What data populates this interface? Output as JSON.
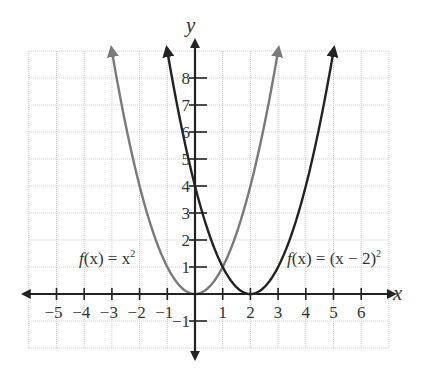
{
  "chart_data": {
    "type": "line",
    "title": "",
    "xlabel": "x",
    "ylabel": "y",
    "xlim": [
      -6,
      7
    ],
    "ylim": [
      -2,
      9
    ],
    "grid": true,
    "x_ticks": [
      -5,
      -4,
      -3,
      -2,
      -1,
      1,
      2,
      3,
      4,
      5,
      6
    ],
    "y_ticks": [
      -1,
      1,
      2,
      3,
      4,
      5,
      6,
      7,
      8
    ],
    "x_tick_labels": [
      "−5",
      "−4",
      "−3",
      "−2",
      "−1",
      "1",
      "2",
      "3",
      "4",
      "5",
      "6"
    ],
    "y_tick_labels": [
      "−1",
      "1",
      "2",
      "3",
      "4",
      "5",
      "6",
      "7",
      "8"
    ],
    "series": [
      {
        "name": "f(x) = x²",
        "color": "#7a7a7a",
        "x_range": [
          -3,
          3
        ],
        "x": [
          -3,
          -2,
          -1,
          0,
          1,
          2,
          3
        ],
        "y": [
          9,
          4,
          1,
          0,
          1,
          4,
          9
        ],
        "label": {
          "pre": "f",
          "mid": "(x) = x",
          "sup": "2"
        }
      },
      {
        "name": "f(x) = (x − 2)²",
        "color": "#222222",
        "x_range": [
          -1,
          5
        ],
        "x": [
          -1,
          0,
          1,
          2,
          3,
          4,
          5
        ],
        "y": [
          9,
          4,
          1,
          0,
          1,
          4,
          9
        ],
        "label": {
          "pre": "f",
          "mid": "(x) = (x − 2)",
          "sup": "2"
        }
      }
    ],
    "annotations": [
      "f(x) = x²",
      "f(x) = (x − 2)²"
    ]
  },
  "axes": {
    "x_label": "x",
    "y_label": "y"
  },
  "labels": {
    "f1_pre": "f",
    "f1_mid": "(x) = x",
    "f1_sup": "2",
    "f2_pre": "f",
    "f2_mid": "(x) = (x − 2)",
    "f2_sup": "2"
  }
}
